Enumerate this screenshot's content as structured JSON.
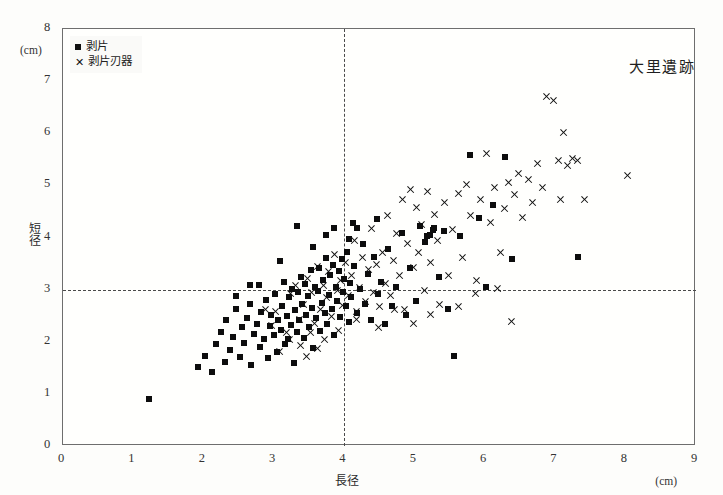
{
  "figure": {
    "site_title": "大里遺跡",
    "background_color": "#fdfdfb",
    "frame_color": "#6e6e6e"
  },
  "legend": {
    "entries": [
      {
        "marker": "square",
        "label": "剥片"
      },
      {
        "marker": "x",
        "label": "剥片刃器"
      }
    ]
  },
  "axes": {
    "x": {
      "title": "長径",
      "unit": "(cm)",
      "ticks": [
        "0",
        "1",
        "2",
        "3",
        "4",
        "5",
        "6",
        "7",
        "8",
        "9"
      ]
    },
    "y": {
      "title": "短径",
      "unit": "(cm)",
      "ticks": [
        "0",
        "1",
        "2",
        "3",
        "4",
        "5",
        "6",
        "7",
        "8"
      ]
    }
  },
  "reference_lines": {
    "vertical_x": 4,
    "horizontal_y": 3,
    "style": "dashed"
  },
  "chart_data": {
    "type": "scatter",
    "title": "大里遺跡",
    "xlabel": "長径",
    "ylabel": "短径",
    "xunit": "(cm)",
    "yunit": "(cm)",
    "xlim": [
      0,
      9
    ],
    "ylim": [
      0,
      8
    ],
    "xticks": [
      0,
      1,
      2,
      3,
      4,
      5,
      6,
      7,
      8,
      9
    ],
    "yticks": [
      0,
      1,
      2,
      3,
      4,
      5,
      6,
      7,
      8
    ],
    "grid": false,
    "legend_position": "top-left",
    "reference_lines": [
      {
        "axis": "x",
        "value": 4,
        "style": "dashed"
      },
      {
        "axis": "y",
        "value": 3,
        "style": "dashed"
      }
    ],
    "series": [
      {
        "name": "剥片",
        "marker": "square",
        "color": "#0d0d0d",
        "points": [
          [
            1.22,
            0.9
          ],
          [
            1.92,
            1.52
          ],
          [
            2.02,
            1.72
          ],
          [
            2.12,
            1.42
          ],
          [
            2.18,
            1.95
          ],
          [
            2.24,
            2.18
          ],
          [
            2.3,
            1.62
          ],
          [
            2.32,
            2.42
          ],
          [
            2.38,
            1.85
          ],
          [
            2.42,
            2.1
          ],
          [
            2.46,
            2.62
          ],
          [
            2.52,
            1.7
          ],
          [
            2.54,
            2.28
          ],
          [
            2.58,
            1.98
          ],
          [
            2.62,
            2.45
          ],
          [
            2.66,
            2.72
          ],
          [
            2.68,
            1.55
          ],
          [
            2.72,
            2.15
          ],
          [
            2.76,
            2.35
          ],
          [
            2.8,
            1.9
          ],
          [
            2.82,
            2.58
          ],
          [
            2.86,
            2.05
          ],
          [
            2.88,
            2.8
          ],
          [
            2.92,
            1.68
          ],
          [
            2.94,
            2.3
          ],
          [
            2.96,
            2.52
          ],
          [
            3.0,
            2.12
          ],
          [
            3.02,
            2.92
          ],
          [
            3.04,
            1.8
          ],
          [
            3.06,
            2.42
          ],
          [
            3.1,
            2.22
          ],
          [
            3.12,
            2.68
          ],
          [
            3.14,
            3.15
          ],
          [
            3.16,
            1.95
          ],
          [
            3.18,
            2.5
          ],
          [
            3.2,
            2.05
          ],
          [
            3.22,
            2.85
          ],
          [
            3.24,
            2.32
          ],
          [
            3.26,
            3.02
          ],
          [
            3.28,
            1.6
          ],
          [
            3.3,
            2.6
          ],
          [
            3.32,
            2.18
          ],
          [
            3.34,
            2.95
          ],
          [
            3.36,
            2.42
          ],
          [
            3.38,
            3.25
          ],
          [
            3.4,
            2.72
          ],
          [
            3.42,
            2.08
          ],
          [
            3.44,
            3.1
          ],
          [
            3.46,
            2.52
          ],
          [
            3.48,
            2.88
          ],
          [
            3.5,
            2.28
          ],
          [
            3.52,
            3.38
          ],
          [
            3.54,
            2.65
          ],
          [
            3.56,
            1.88
          ],
          [
            3.58,
            3.05
          ],
          [
            3.6,
            2.45
          ],
          [
            3.62,
            2.98
          ],
          [
            3.64,
            3.42
          ],
          [
            3.66,
            2.2
          ],
          [
            3.68,
            2.75
          ],
          [
            3.7,
            3.18
          ],
          [
            3.72,
            2.55
          ],
          [
            3.74,
            3.6
          ],
          [
            3.76,
            2.35
          ],
          [
            3.78,
            2.9
          ],
          [
            3.8,
            3.28
          ],
          [
            3.82,
            2.62
          ],
          [
            3.84,
            3.48
          ],
          [
            3.86,
            2.12
          ],
          [
            3.88,
            3.05
          ],
          [
            3.9,
            2.78
          ],
          [
            3.92,
            3.35
          ],
          [
            3.94,
            2.48
          ],
          [
            3.96,
            3.58
          ],
          [
            3.98,
            2.95
          ],
          [
            4.0,
            3.2
          ],
          [
            4.02,
            2.68
          ],
          [
            4.04,
            3.72
          ],
          [
            4.06,
            2.38
          ],
          [
            4.08,
            3.12
          ],
          [
            4.1,
            2.85
          ],
          [
            4.14,
            3.45
          ],
          [
            4.18,
            2.55
          ],
          [
            4.22,
            3.02
          ],
          [
            4.26,
            3.88
          ],
          [
            4.3,
            2.72
          ],
          [
            4.34,
            3.3
          ],
          [
            4.38,
            2.42
          ],
          [
            4.42,
            3.62
          ],
          [
            4.48,
            2.92
          ],
          [
            4.52,
            3.15
          ],
          [
            4.58,
            2.35
          ],
          [
            4.62,
            3.78
          ],
          [
            4.68,
            2.68
          ],
          [
            4.74,
            3.05
          ],
          [
            4.82,
            4.08
          ],
          [
            4.88,
            2.52
          ],
          [
            4.94,
            3.42
          ],
          [
            5.02,
            2.78
          ],
          [
            5.08,
            4.22
          ],
          [
            5.14,
            3.92
          ],
          [
            5.22,
            4.05
          ],
          [
            5.28,
            4.18
          ],
          [
            5.34,
            3.25
          ],
          [
            5.42,
            4.12
          ],
          [
            5.48,
            2.62
          ],
          [
            5.56,
            1.72
          ],
          [
            5.64,
            4.02
          ],
          [
            5.78,
            5.58
          ],
          [
            5.92,
            4.38
          ],
          [
            6.02,
            3.05
          ],
          [
            6.12,
            4.62
          ],
          [
            6.28,
            5.55
          ],
          [
            6.38,
            3.58
          ],
          [
            3.32,
            4.22
          ],
          [
            3.74,
            4.05
          ],
          [
            4.18,
            4.18
          ],
          [
            2.78,
            3.08
          ],
          [
            3.08,
            3.55
          ],
          [
            3.56,
            3.82
          ],
          [
            4.46,
            4.35
          ],
          [
            5.18,
            4.02
          ],
          [
            5.26,
            4.14
          ],
          [
            7.32,
            3.62
          ],
          [
            2.46,
            2.88
          ],
          [
            2.66,
            3.08
          ],
          [
            3.86,
            4.18
          ],
          [
            4.06,
            3.98
          ],
          [
            4.12,
            4.28
          ]
        ]
      },
      {
        "name": "剥片刃器",
        "marker": "x",
        "color": "#111111",
        "points": [
          [
            3.02,
            2.58
          ],
          [
            3.18,
            2.18
          ],
          [
            3.24,
            2.92
          ],
          [
            3.3,
            3.08
          ],
          [
            3.36,
            2.42
          ],
          [
            3.42,
            2.72
          ],
          [
            3.48,
            3.22
          ],
          [
            3.54,
            2.95
          ],
          [
            3.58,
            2.35
          ],
          [
            3.62,
            3.45
          ],
          [
            3.66,
            2.62
          ],
          [
            3.7,
            3.08
          ],
          [
            3.74,
            2.85
          ],
          [
            3.78,
            3.35
          ],
          [
            3.82,
            2.48
          ],
          [
            3.86,
            3.68
          ],
          [
            3.9,
            2.98
          ],
          [
            3.94,
            3.18
          ],
          [
            3.98,
            2.7
          ],
          [
            4.02,
            3.52
          ],
          [
            4.06,
            2.88
          ],
          [
            4.1,
            3.28
          ],
          [
            4.14,
            3.95
          ],
          [
            4.18,
            2.58
          ],
          [
            4.22,
            3.05
          ],
          [
            4.26,
            3.62
          ],
          [
            4.3,
            2.78
          ],
          [
            4.34,
            3.38
          ],
          [
            4.38,
            4.18
          ],
          [
            4.42,
            2.95
          ],
          [
            4.46,
            3.48
          ],
          [
            4.5,
            2.68
          ],
          [
            4.54,
            3.72
          ],
          [
            4.58,
            3.12
          ],
          [
            4.62,
            4.42
          ],
          [
            4.66,
            2.88
          ],
          [
            4.7,
            3.55
          ],
          [
            4.74,
            4.08
          ],
          [
            4.78,
            3.28
          ],
          [
            4.82,
            4.72
          ],
          [
            4.86,
            2.62
          ],
          [
            4.9,
            3.88
          ],
          [
            4.94,
            4.92
          ],
          [
            4.98,
            3.42
          ],
          [
            5.02,
            4.58
          ],
          [
            5.06,
            3.72
          ],
          [
            5.1,
            4.25
          ],
          [
            5.14,
            2.98
          ],
          [
            5.18,
            4.88
          ],
          [
            5.22,
            3.52
          ],
          [
            5.28,
            4.45
          ],
          [
            5.32,
            3.95
          ],
          [
            5.36,
            2.72
          ],
          [
            5.42,
            4.68
          ],
          [
            5.48,
            3.28
          ],
          [
            5.54,
            4.15
          ],
          [
            5.62,
            4.85
          ],
          [
            5.68,
            3.62
          ],
          [
            5.74,
            5.02
          ],
          [
            5.8,
            4.42
          ],
          [
            5.88,
            3.18
          ],
          [
            5.94,
            4.72
          ],
          [
            6.02,
            5.62
          ],
          [
            6.08,
            4.28
          ],
          [
            6.14,
            4.95
          ],
          [
            6.22,
            3.72
          ],
          [
            6.28,
            4.55
          ],
          [
            6.34,
            5.05
          ],
          [
            6.42,
            4.82
          ],
          [
            6.48,
            5.22
          ],
          [
            6.54,
            4.38
          ],
          [
            6.62,
            5.12
          ],
          [
            6.68,
            4.68
          ],
          [
            6.74,
            5.42
          ],
          [
            6.82,
            4.95
          ],
          [
            6.88,
            6.7
          ],
          [
            6.98,
            6.62
          ],
          [
            7.04,
            5.48
          ],
          [
            7.12,
            6.02
          ],
          [
            7.18,
            5.38
          ],
          [
            7.24,
            5.52
          ],
          [
            7.32,
            5.48
          ],
          [
            7.08,
            4.72
          ],
          [
            7.42,
            4.72
          ],
          [
            8.02,
            5.18
          ],
          [
            6.38,
            2.38
          ],
          [
            5.62,
            2.68
          ],
          [
            5.22,
            2.52
          ],
          [
            4.98,
            2.35
          ],
          [
            4.72,
            2.62
          ],
          [
            4.48,
            2.28
          ],
          [
            4.18,
            2.42
          ],
          [
            3.92,
            2.22
          ],
          [
            3.72,
            2.05
          ],
          [
            3.52,
            2.18
          ],
          [
            3.38,
            1.92
          ],
          [
            3.22,
            2.05
          ],
          [
            3.08,
            1.82
          ],
          [
            2.96,
            2.32
          ],
          [
            2.88,
            2.62
          ],
          [
            3.46,
            1.72
          ],
          [
            3.62,
            1.88
          ],
          [
            6.18,
            3.02
          ],
          [
            5.86,
            2.92
          ]
        ]
      }
    ]
  }
}
